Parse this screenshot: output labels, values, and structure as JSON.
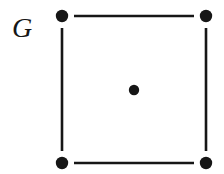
{
  "figure": {
    "kind": "graph-diagram",
    "background_color": "#ffffff",
    "ink_color": "#161616",
    "width": 224,
    "height": 174
  },
  "label": {
    "text": "G",
    "style": "italic-serif",
    "font_size_px": 28,
    "x": 12,
    "y": 14
  },
  "chart_data": {
    "type": "diagram",
    "title": "G",
    "vertex_count": 5,
    "edge_count": 4,
    "vertex_radius_px": 6.2,
    "center_vertex_radius_px": 5.2,
    "edge_width_px": 2.6,
    "edge_gap_px": 10,
    "vertices": [
      {
        "id": "top-left",
        "x": 62,
        "y": 16,
        "r": 6.2,
        "degree": 2
      },
      {
        "id": "top-right",
        "x": 206,
        "y": 16,
        "r": 6.2,
        "degree": 2
      },
      {
        "id": "bottom-left",
        "x": 62,
        "y": 163,
        "r": 6.2,
        "degree": 2
      },
      {
        "id": "bottom-right",
        "x": 206,
        "y": 163,
        "r": 6.2,
        "degree": 2
      },
      {
        "id": "center",
        "x": 134,
        "y": 90,
        "r": 5.2,
        "degree": 0
      }
    ],
    "edges": [
      {
        "id": "top",
        "from": "top-left",
        "to": "top-right",
        "x1": 74,
        "y1": 16,
        "x2": 194,
        "y2": 16
      },
      {
        "id": "right",
        "from": "top-right",
        "to": "bottom-right",
        "x1": 206,
        "y1": 28,
        "x2": 206,
        "y2": 151
      },
      {
        "id": "bottom",
        "from": "bottom-left",
        "to": "bottom-right",
        "x1": 74,
        "y1": 163,
        "x2": 194,
        "y2": 163
      },
      {
        "id": "left",
        "from": "top-left",
        "to": "bottom-left",
        "x1": 62,
        "y1": 28,
        "x2": 62,
        "y2": 151
      }
    ]
  }
}
